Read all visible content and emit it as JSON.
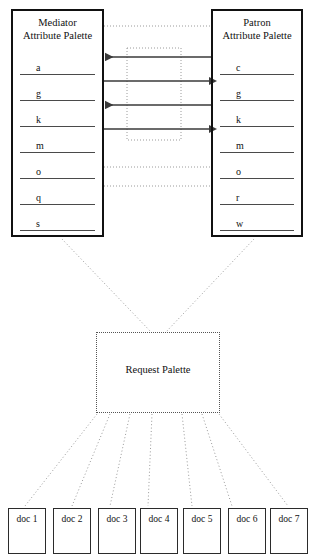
{
  "diagram": {
    "mediator": {
      "title_line1": "Mediator",
      "title_line2": "Attribute Palette",
      "attributes": [
        "a",
        "g",
        "k",
        "m",
        "o",
        "q",
        "s"
      ]
    },
    "patron": {
      "title_line1": "Patron",
      "title_line2": "Attribute Palette",
      "attributes": [
        "c",
        "g",
        "k",
        "m",
        "o",
        "r",
        "w"
      ]
    },
    "request": {
      "label": "Request Palette"
    },
    "documents": [
      {
        "label": "doc 1"
      },
      {
        "label": "doc 2"
      },
      {
        "label": "doc 3"
      },
      {
        "label": "doc 4"
      },
      {
        "label": "doc 5"
      },
      {
        "label": "doc 6"
      },
      {
        "label": "doc 7"
      }
    ],
    "exchange_arrows": [
      {
        "direction": "left",
        "y": 57
      },
      {
        "direction": "right",
        "y": 81
      },
      {
        "direction": "left",
        "y": 105
      },
      {
        "direction": "right",
        "y": 129
      }
    ],
    "dotted_connector_rows": [
      26,
      167,
      186
    ],
    "colors": {
      "box_stroke": "#111111",
      "doc_stroke": "#2b2b2b",
      "arrow": "#3a3a3a",
      "dotted": "#808080",
      "attribute_rule": "#4a4a4a",
      "text": "#111111",
      "background": "#ffffff"
    }
  }
}
